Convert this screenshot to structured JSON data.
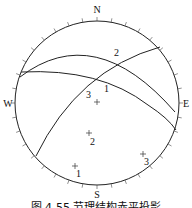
{
  "diagram": {
    "type": "stereographic-projection",
    "directions": {
      "north": "N",
      "south": "S",
      "east": "E",
      "west": "W"
    },
    "great_circles": [
      {
        "label": "1"
      },
      {
        "label": "2"
      },
      {
        "label": "3"
      }
    ],
    "poles": [
      {
        "label": "1"
      },
      {
        "label": "2"
      },
      {
        "label": "3"
      }
    ],
    "center_mark": "+",
    "caption": "图 4-55  节理结构赤平投影"
  }
}
